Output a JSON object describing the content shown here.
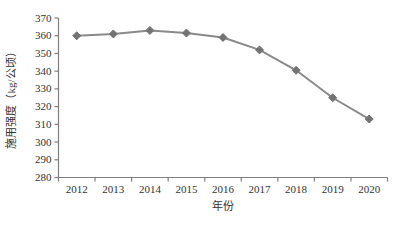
{
  "chart_data": {
    "type": "line",
    "title": "",
    "x": [
      "2012",
      "2013",
      "2014",
      "2015",
      "2016",
      "2017",
      "2018",
      "2019",
      "2020"
    ],
    "series": [
      {
        "name": "施用强度",
        "values": [
          360,
          361,
          363,
          361.5,
          359,
          352,
          340.5,
          325,
          313
        ],
        "marker": "diamond"
      }
    ],
    "xlabel": "年份",
    "ylabel": "施用强度（kg/公顷）",
    "ylim": [
      280,
      370
    ],
    "ytick_step": 10,
    "yticks": [
      280,
      290,
      300,
      310,
      320,
      330,
      340,
      350,
      360,
      370
    ],
    "grid": false,
    "legend": "none"
  },
  "colors": {
    "line": "#8a8a8a",
    "marker": "#737373",
    "axis": "#7f7f7f",
    "text": "#333333",
    "background": "#ffffff"
  }
}
